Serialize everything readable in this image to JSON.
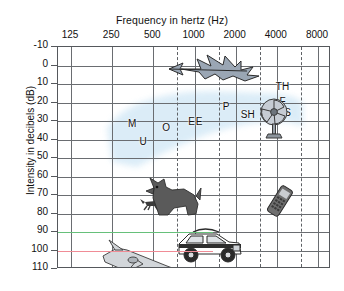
{
  "chart_data": {
    "type": "scatter",
    "title": "",
    "xlabel": "Frequency in hertz (Hz)",
    "ylabel": "Intensity in decibels (dB)",
    "xscale": "log",
    "x_ticks": [
      "125",
      "250",
      "500",
      "1000",
      "2000",
      "4000",
      "8000"
    ],
    "x_tick_values": [
      125,
      250,
      500,
      1000,
      2000,
      4000,
      8000
    ],
    "y_ticks": [
      "-10",
      "0",
      "10",
      "20",
      "30",
      "40",
      "50",
      "60",
      "70",
      "80",
      "90",
      "100",
      "110"
    ],
    "y_tick_values": [
      -10,
      0,
      10,
      20,
      30,
      40,
      50,
      60,
      70,
      80,
      90,
      100,
      110
    ],
    "ylim": [
      -10,
      110
    ],
    "y_inverted": true,
    "grid": "solid octave lines with dashed half-octave lines",
    "legend": "none",
    "reference_lines": [
      {
        "name": "green-line-90db",
        "y": 90,
        "color": "#66c07a",
        "x_start": 125,
        "x_end": 1400
      },
      {
        "name": "red-line-100db",
        "y": 100,
        "color": "#f08c96",
        "x_start": 125,
        "x_end": 1400
      }
    ],
    "speech_banana": {
      "label": "speech banana region",
      "color": "#cfe6f5",
      "description": "shaded crescent spanning roughly 250-6000 Hz between 15 and 55 dB"
    },
    "phonemes": [
      {
        "label": "M",
        "freq": 350,
        "db": 31
      },
      {
        "label": "U",
        "freq": 420,
        "db": 41
      },
      {
        "label": "O",
        "freq": 620,
        "db": 33
      },
      {
        "label": "E",
        "freq": 950,
        "db": 30
      },
      {
        "label": "E",
        "freq": 1080,
        "db": 30
      },
      {
        "label": "P",
        "freq": 1700,
        "db": 22
      },
      {
        "label": "SH",
        "freq": 2450,
        "db": 26
      },
      {
        "label": "TH",
        "freq": 4400,
        "db": 11
      },
      {
        "label": "F",
        "freq": 4400,
        "db": 19
      },
      {
        "label": "S",
        "freq": 4800,
        "db": 25
      }
    ],
    "sound_sources": [
      {
        "name": "bird",
        "freq": 1400,
        "db": 3,
        "icon": "bird-icon"
      },
      {
        "name": "desk-fan",
        "freq": 3800,
        "db": 30,
        "icon": "fan-icon"
      },
      {
        "name": "small-dog",
        "freq": 480,
        "db": 76,
        "icon": "running-dog-icon"
      },
      {
        "name": "barking-dog",
        "freq": 700,
        "db": 72,
        "icon": "barking-dog-icon"
      },
      {
        "name": "mobile-phone",
        "freq": 4300,
        "db": 76,
        "icon": "mobile-phone-icon"
      },
      {
        "name": "car",
        "freq": 1250,
        "db": 98,
        "icon": "car-icon"
      },
      {
        "name": "airplane",
        "freq": 420,
        "db": 107,
        "icon": "airplane-icon"
      }
    ]
  }
}
